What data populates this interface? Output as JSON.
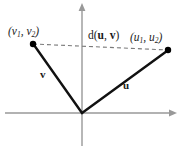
{
  "figure": {
    "background_color": "#ffffff",
    "width": 187,
    "height": 150,
    "axis_color": "#999999",
    "vector_color": "#111111",
    "dash_color": "#7a7a7a",
    "point_color": "#000000"
  },
  "labels": {
    "point_v": {
      "text": "(v",
      "sub1": "1",
      "mid": ", v",
      "sub2": "2",
      "close": ")"
    },
    "point_u": {
      "text": "(u",
      "sub1": "1",
      "mid": ", u",
      "sub2": "2",
      "close": ")"
    },
    "distance": {
      "prefix": "d(",
      "arg1": "u",
      "sep": ", ",
      "arg2": "v",
      "close": ")"
    },
    "vector_v": "v",
    "vector_u": "u"
  },
  "geometry": {
    "origin": {
      "x": 82,
      "y": 113
    },
    "y_axis": {
      "x": 82,
      "top": 5,
      "bottom": 146
    },
    "x_axis": {
      "y": 113,
      "left": 5,
      "right": 176
    },
    "point_v": {
      "x": 33,
      "y": 44
    },
    "point_u": {
      "x": 168,
      "y": 50
    },
    "dot_radius": 3.2,
    "vector_stroke_width": 2.4,
    "axis_stroke_width": 1.4,
    "dash_pattern": "4,3"
  }
}
